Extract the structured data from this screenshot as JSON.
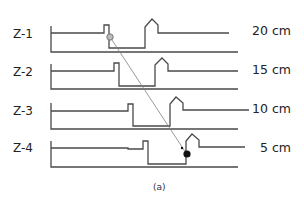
{
  "rows": [
    {
      "label": "Z-1",
      "distance": "20 cm"
    },
    {
      "label": "Z-2",
      "distance": "15 cm"
    },
    {
      "label": "Z-3",
      "distance": "10 cm"
    },
    {
      "label": "Z-4",
      "distance": "5 cm"
    }
  ],
  "caption": "(a)",
  "colors": {
    "line": "#4a4a4a",
    "arrow": "#808080",
    "marker": "#111111"
  }
}
